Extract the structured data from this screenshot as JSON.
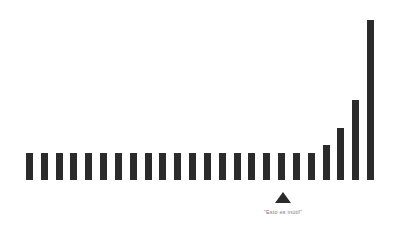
{
  "chart_data": {
    "type": "bar",
    "title": "",
    "subtitle": "",
    "xlabel": "",
    "ylabel": "",
    "grid": false,
    "legend": null,
    "bar_color": "#2b2b2b",
    "background_color": "#ffffff",
    "baseline_y": 180,
    "x_start": 22,
    "x_end": 378,
    "bar_width": 7,
    "bar_gap": 8,
    "ylim": [
      0,
      170
    ],
    "categories": [
      "1",
      "2",
      "3",
      "4",
      "5",
      "6",
      "7",
      "8",
      "9",
      "10",
      "11",
      "12",
      "13",
      "14",
      "15",
      "16",
      "17",
      "18",
      "19",
      "20",
      "21",
      "22",
      "23",
      "24"
    ],
    "values": [
      27,
      27,
      27,
      27,
      27,
      27,
      27,
      27,
      27,
      27,
      27,
      27,
      27,
      27,
      27,
      27,
      27,
      27,
      27,
      27,
      35,
      52,
      80,
      160
    ],
    "annotations": [
      {
        "name": "pointer-annotation",
        "marker": "triangle-up",
        "marker_color": "#2b2b2b",
        "attached_to_category": "19",
        "x": 283,
        "marker_y": 192,
        "label": "\"Esto es inútil\"",
        "label_y": 210,
        "label_color": "#7a7a7a"
      }
    ]
  }
}
